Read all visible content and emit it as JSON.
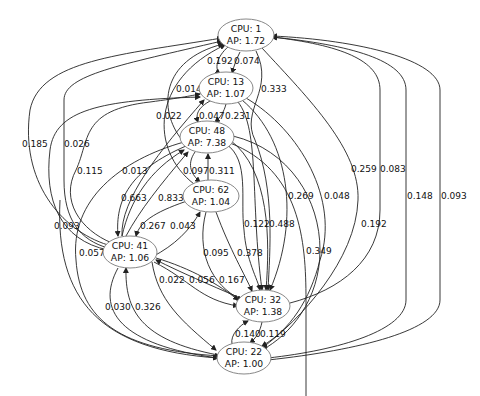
{
  "graph": {
    "type": "directed",
    "nodes": [
      {
        "id": "n1",
        "cpu_label": "CPU: 1",
        "ap_label": "AP: 1.72",
        "cx": 246,
        "cy": 35
      },
      {
        "id": "n13",
        "cpu_label": "CPU: 13",
        "ap_label": "AP: 1.07",
        "cx": 226,
        "cy": 88
      },
      {
        "id": "n48",
        "cpu_label": "CPU: 48",
        "ap_label": "AP: 7.38",
        "cx": 207,
        "cy": 137
      },
      {
        "id": "n62",
        "cpu_label": "CPU: 62",
        "ap_label": "AP: 1.04",
        "cx": 211,
        "cy": 196
      },
      {
        "id": "n41",
        "cpu_label": "CPU: 41",
        "ap_label": "AP: 1.06",
        "cx": 130,
        "cy": 252
      },
      {
        "id": "n32",
        "cpu_label": "CPU: 32",
        "ap_label": "AP: 1.38",
        "cx": 263,
        "cy": 306
      },
      {
        "id": "n22",
        "cpu_label": "CPU: 22",
        "ap_label": "AP: 1.00",
        "cx": 244,
        "cy": 358
      }
    ],
    "edge_labels": [
      {
        "text": "0.192",
        "x": 207,
        "y": 64
      },
      {
        "text": "0.074",
        "x": 234,
        "y": 64
      },
      {
        "text": "0.014",
        "x": 176,
        "y": 92
      },
      {
        "text": "0.333",
        "x": 261,
        "y": 92
      },
      {
        "text": "0.022",
        "x": 156,
        "y": 119
      },
      {
        "text": "0.047",
        "x": 199,
        "y": 119
      },
      {
        "text": "0.231",
        "x": 225,
        "y": 119
      },
      {
        "text": "0.185",
        "x": 22,
        "y": 147
      },
      {
        "text": "0.026",
        "x": 64,
        "y": 147
      },
      {
        "text": "0.115",
        "x": 77,
        "y": 174
      },
      {
        "text": "0.013",
        "x": 122,
        "y": 174
      },
      {
        "text": "0.097",
        "x": 183,
        "y": 174
      },
      {
        "text": "0.311",
        "x": 209,
        "y": 174
      },
      {
        "text": "0.663",
        "x": 121,
        "y": 201
      },
      {
        "text": "0.833",
        "x": 158,
        "y": 201
      },
      {
        "text": "0.259",
        "x": 351,
        "y": 172
      },
      {
        "text": "0.083",
        "x": 380,
        "y": 172
      },
      {
        "text": "0.269",
        "x": 288,
        "y": 199
      },
      {
        "text": "0.048",
        "x": 324,
        "y": 199
      },
      {
        "text": "0.148",
        "x": 407,
        "y": 199
      },
      {
        "text": "0.093",
        "x": 441,
        "y": 199
      },
      {
        "text": "0.122",
        "x": 244,
        "y": 227
      },
      {
        "text": "0.488",
        "x": 269,
        "y": 227
      },
      {
        "text": "0.192",
        "x": 361,
        "y": 227
      },
      {
        "text": "0.267",
        "x": 140,
        "y": 229
      },
      {
        "text": "0.043",
        "x": 170,
        "y": 229
      },
      {
        "text": "0.093",
        "x": 54,
        "y": 229
      },
      {
        "text": "0.057",
        "x": 79,
        "y": 256
      },
      {
        "text": "0.095",
        "x": 203,
        "y": 256
      },
      {
        "text": "0.378",
        "x": 237,
        "y": 256
      },
      {
        "text": "0.349",
        "x": 306,
        "y": 254
      },
      {
        "text": "0.022",
        "x": 159,
        "y": 283
      },
      {
        "text": "0.056",
        "x": 189,
        "y": 283
      },
      {
        "text": "0.167",
        "x": 219,
        "y": 283
      },
      {
        "text": "0.030",
        "x": 105,
        "y": 310
      },
      {
        "text": "0.326",
        "x": 135,
        "y": 310
      },
      {
        "text": "0.140",
        "x": 235,
        "y": 337
      },
      {
        "text": "0.119",
        "x": 260,
        "y": 337
      }
    ]
  },
  "colors": {
    "node_border": "#888888",
    "edge": "#222222",
    "background": "#ffffff"
  }
}
